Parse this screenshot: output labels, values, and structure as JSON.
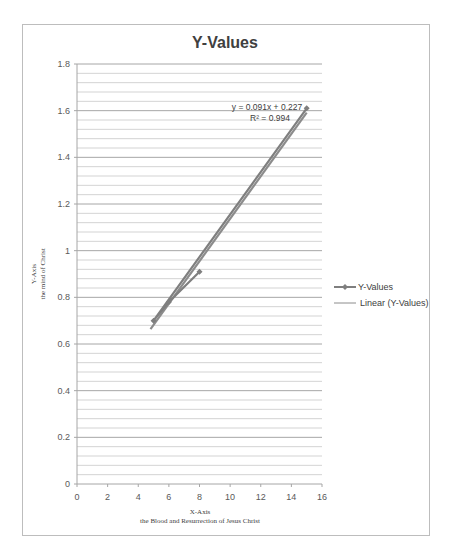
{
  "chart_data": {
    "type": "line",
    "title": "Y-Values",
    "xlabel": "X-Axis",
    "xlabel_sub": "the Blood and Resurrection of Jesus Christ",
    "ylabel": "Y-Axis",
    "ylabel_sub": "the mind of Christ",
    "xlim": [
      0,
      16
    ],
    "ylim": [
      0,
      1.8
    ],
    "x_ticks": [
      0,
      2,
      4,
      6,
      8,
      10,
      12,
      14,
      16
    ],
    "y_ticks": [
      "0",
      "0.2",
      "0.4",
      "0.6",
      "0.8",
      "1",
      "1.2",
      "1.4",
      "1.6",
      "1.8"
    ],
    "y_tick_values": [
      0,
      0.2,
      0.4,
      0.6,
      0.8,
      1.0,
      1.2,
      1.4,
      1.6,
      1.8
    ],
    "minor_grid_step": 0.04,
    "grid": true,
    "legend_position": "right",
    "series": [
      {
        "name": "Y-Values",
        "color": "#7f7f7f",
        "marker": "diamond",
        "points": [
          [
            15,
            1.61
          ],
          [
            5,
            0.7
          ],
          [
            6,
            0.78
          ],
          [
            8,
            0.91
          ]
        ]
      }
    ],
    "trendline": {
      "name": "Linear (Y-Values)",
      "color": "#8c8c8c",
      "slope": 0.091,
      "intercept": 0.227,
      "x_range": [
        4.8,
        15
      ],
      "equation": "y = 0.091x + 0.227",
      "r_squared": "R² = 0.994"
    }
  }
}
